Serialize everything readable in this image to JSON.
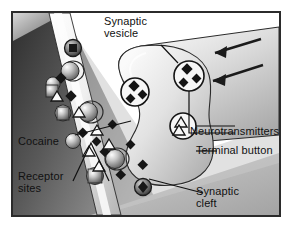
{
  "figure": {
    "frame_border_color": "#2b2b2b",
    "background_color": "#ffffff"
  },
  "labels": [
    {
      "name": "synaptic-vesicle",
      "text": "Synaptic\nvesicle",
      "x": 104,
      "y": 16
    },
    {
      "name": "neurotransmitters",
      "text": "Neurotransmitters",
      "x": 190,
      "y": 126
    },
    {
      "name": "terminal-button",
      "text": "Terminal button",
      "x": 196,
      "y": 145
    },
    {
      "name": "cocaine",
      "text": "Cocaine",
      "x": 18,
      "y": 136
    },
    {
      "name": "receptor-sites",
      "text": "Receptor\nsites",
      "x": 18,
      "y": 171
    },
    {
      "name": "synaptic-cleft",
      "text": "Synaptic\ncleft",
      "x": 196,
      "y": 186
    }
  ],
  "structures": {
    "presynaptic_axon": "axon ending in terminal button, upper right",
    "postsynaptic_membrane": "diagonal band running lower-left to upper-left",
    "postsynaptic_cell": "dark gradient region, lower left",
    "signal_arrows": 2,
    "signal_arrow_direction": "toward terminal button (leftward/down-left)"
  },
  "particles": {
    "neurotransmitter_diamond": {
      "glyph": "diamond",
      "count": 9,
      "fill": "#161616"
    },
    "neurotransmitter_triangle": {
      "glyph": "triangle",
      "count": 6,
      "fill": "#ffffff",
      "stroke": "#161616"
    },
    "vesicles_with_diamonds": 2,
    "vesicles_with_triangles": 1,
    "receptor_knobs": 6,
    "reuptake_pores": 2
  },
  "colors": {
    "line": "#161616",
    "membrane_light": "#f2f2f2",
    "membrane_mid": "#b9b9b9",
    "terminal_light": "#e9e9e9",
    "terminal_mid": "#c2c2c2",
    "cell_dark": "#4a4a4a",
    "cell_darkest": "#2e2e2e",
    "text": "#111111"
  }
}
